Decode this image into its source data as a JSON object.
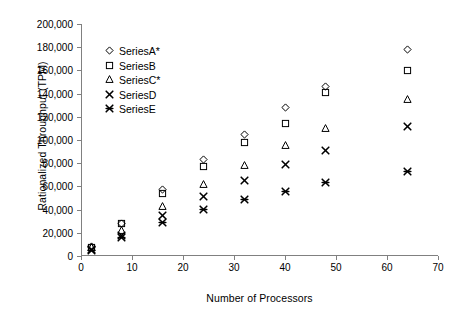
{
  "chart_data": {
    "type": "scatter",
    "title": "",
    "xlabel": "Number of Processors",
    "ylabel": "Rationalized Throughput (TPM)",
    "xlim": [
      0,
      70
    ],
    "ylim": [
      0,
      200000
    ],
    "xticks": [
      0,
      10,
      20,
      30,
      40,
      50,
      60,
      70
    ],
    "xtick_labels": [
      "0",
      "10",
      "20",
      "30",
      "40",
      "50",
      "60",
      "70"
    ],
    "yticks": [
      0,
      20000,
      40000,
      60000,
      80000,
      100000,
      120000,
      140000,
      160000,
      180000,
      200000
    ],
    "ytick_labels": [
      "0",
      "20,000",
      "40,000",
      "60,000",
      "80,000",
      "100,000",
      "120,000",
      "140,000",
      "160,000",
      "180,000",
      "200,000"
    ],
    "grid": false,
    "legend_position": "upper-left-inside",
    "x": [
      2,
      8,
      16,
      24,
      32,
      40,
      48,
      64
    ],
    "series": [
      {
        "name": "SeriesA*",
        "marker": "diamond",
        "values": [
          8000,
          28000,
          57000,
          83000,
          105000,
          128000,
          146000,
          178000
        ]
      },
      {
        "name": "SeriesB",
        "marker": "square",
        "values": [
          7500,
          28000,
          54000,
          77000,
          98000,
          114000,
          141000,
          160000
        ]
      },
      {
        "name": "SeriesC*",
        "marker": "triangle",
        "values": [
          7000,
          22000,
          43000,
          62000,
          78000,
          95000,
          110000,
          135000
        ]
      },
      {
        "name": "SeriesD",
        "marker": "cross",
        "values": [
          6000,
          18000,
          35000,
          51000,
          65000,
          79000,
          91000,
          112000
        ]
      },
      {
        "name": "SeriesE",
        "marker": "star",
        "values": [
          5000,
          16000,
          29000,
          40000,
          49000,
          56000,
          63000,
          73000
        ]
      }
    ],
    "colors": {
      "marker": "#000000",
      "axis": "#808080",
      "background": "#ffffff"
    }
  }
}
